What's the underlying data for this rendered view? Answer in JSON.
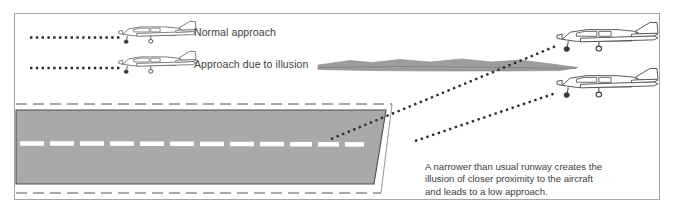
{
  "figure": {
    "background_color": "#ffffff",
    "frame_color": "#a6a6a6",
    "text_color": "#3d3d3d"
  },
  "labels": {
    "normal_approach": "Normal approach",
    "illusion_approach": "Approach due to illusion"
  },
  "caption": {
    "line1": "A narrower than usual runway creates the",
    "line2": "illusion of closer proximity to the aircraft",
    "line3": "and leads to a low approach."
  },
  "runway": {
    "surface_color": "#a9a9a9",
    "outline_color": "#4a4a4a",
    "centerline_color": "#ffffff",
    "edge_marking_color": "#555555",
    "centerline_dash_count": 12,
    "description": "Gray tapering runway trapezoid with white dashed centerline and dashed boundary markings"
  },
  "aircraft": {
    "count": 4,
    "type": "single-engine low-wing airplane",
    "stroke_color": "#4a4a4a",
    "positions": [
      {
        "name": "left-normal-approach-aircraft",
        "x": 118,
        "y": 24
      },
      {
        "name": "left-illusion-approach-aircraft",
        "x": 118,
        "y": 54
      },
      {
        "name": "right-upper-aircraft",
        "x": 556,
        "y": 24
      },
      {
        "name": "right-lower-aircraft",
        "x": 556,
        "y": 70
      }
    ]
  },
  "glide_paths": {
    "dot_color": "#2b2b2b",
    "paths": [
      {
        "name": "normal-approach-dotted-line",
        "type": "horizontal"
      },
      {
        "name": "illusion-approach-dotted-line",
        "type": "horizontal"
      },
      {
        "name": "upper-glide-path-to-threshold",
        "type": "diagonal"
      },
      {
        "name": "lower-glide-path-short",
        "type": "diagonal"
      }
    ]
  },
  "terrain": {
    "color": "#9d9d9d",
    "description": "Thin rolling terrain silhouette between illusion label and right aircraft"
  }
}
